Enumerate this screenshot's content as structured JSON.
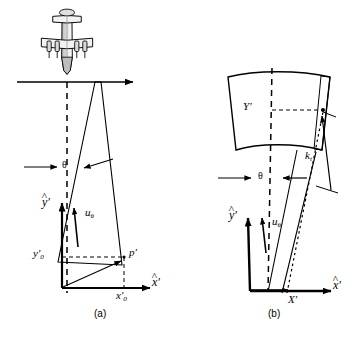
{
  "figure": {
    "caption_a": "(a)",
    "caption_b": "(b)",
    "background_color": "#ffffff",
    "line_color": "#000000"
  },
  "panel_a": {
    "name": "along-track beam geometry",
    "aircraft_icon": "aircraft-top-view-icon",
    "flight_path_arrow": "flight-direction-arrow",
    "labels": {
      "y_axis": "y",
      "y_axis_prime": "'",
      "x_axis": "x",
      "x_axis_prime": "'",
      "theta": "θ",
      "u_theta": "u",
      "u_theta_sub": "θ",
      "point_p": "p",
      "point_p_prime": "'",
      "y0": "y",
      "y0_sub": "0",
      "y0_prime": "'",
      "x0": "x",
      "x0_sub": "0",
      "x0_prime": "'"
    }
  },
  "panel_b": {
    "name": "beam footprint geometry",
    "labels": {
      "Y_prime": "Y",
      "Y_prime_mark": "'",
      "X_prime": "X",
      "X_prime_mark": "'",
      "y_axis": "y",
      "y_axis_prime": "'",
      "x_axis": "x",
      "x_axis_prime": "'",
      "theta": "θ",
      "u_theta": "u",
      "u_theta_sub": "θ",
      "k_t": "k",
      "k_t_sub": "t"
    }
  }
}
